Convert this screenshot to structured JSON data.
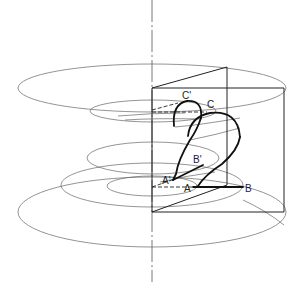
{
  "diagram": {
    "type": "helical screw surface construction",
    "labels": {
      "A": "A",
      "A_prime": "A'",
      "B": "B",
      "B_prime": "B'",
      "C": "C",
      "C_prime": "C'"
    },
    "colors": {
      "stroke": "#222222",
      "thin": "#555555",
      "background": "#ffffff"
    }
  }
}
